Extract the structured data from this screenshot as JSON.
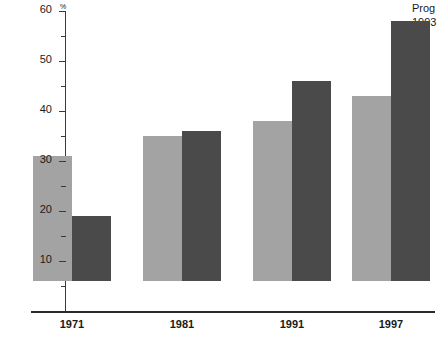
{
  "annotation": {
    "line1": "Prog",
    "line2": "1993"
  },
  "chart_data": {
    "type": "bar",
    "title": "",
    "subtitle": "",
    "xlabel": "",
    "ylabel": "",
    "unit_label": "%",
    "categories": [
      "1971",
      "1981",
      "1991",
      "1997"
    ],
    "series": [
      {
        "name": "series-light",
        "color": "#a3a3a3",
        "values": [
          25,
          29,
          32,
          37
        ]
      },
      {
        "name": "series-dark",
        "color": "#4a4a4a",
        "values": [
          13,
          30,
          40,
          52
        ]
      }
    ],
    "ylim": [
      0,
      60
    ],
    "ytick_labels": [
      "10",
      "20",
      "30",
      "40",
      "50",
      "60"
    ],
    "ytick_values": [
      10,
      20,
      30,
      40,
      50,
      60
    ],
    "yminor_values": [
      5,
      15,
      25,
      35,
      45,
      55
    ],
    "grid": false,
    "legend": "none"
  }
}
